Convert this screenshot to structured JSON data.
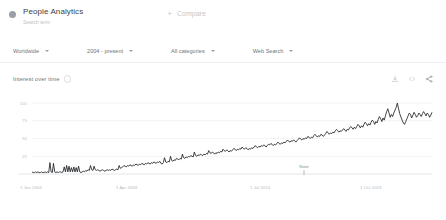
{
  "header": {
    "term_title": "People Analytics",
    "term_subtitle": "Search term",
    "compare_label": "Compare",
    "plus_glyph": "+",
    "dot_icon": "series-color-dot",
    "dot_color": "#9aa0a6"
  },
  "filters": [
    {
      "label": "Worldwide",
      "name": "location"
    },
    {
      "label": "2004 - present",
      "name": "time-range"
    },
    {
      "label": "All categories",
      "name": "category"
    },
    {
      "label": "Web Search",
      "name": "search-type"
    }
  ],
  "chart_card": {
    "title": "Interest over time",
    "help_icon": "help-circle-icon",
    "actions": [
      {
        "name": "download-icon",
        "label": "Download"
      },
      {
        "name": "embed-icon",
        "label": "Embed"
      },
      {
        "name": "share-icon",
        "label": "Share"
      }
    ]
  },
  "chart_data": {
    "type": "line",
    "title": "Interest over time",
    "xlabel": "",
    "ylabel": "",
    "ylim": [
      0,
      110
    ],
    "grid": true,
    "legend": false,
    "line_color": "#202124",
    "yticks": [
      100,
      75,
      50,
      25
    ],
    "xticks": [
      "1 Jan 2004",
      "1 Apr 2009",
      "1 Jul 2014",
      "1 Oct 2019"
    ],
    "xtick_positions_pct": [
      0.5,
      24.5,
      58.0,
      85.5
    ],
    "annotations": [
      {
        "label": "Note",
        "x_pct": 68.0,
        "y_pct": 88.0
      }
    ],
    "series": [
      {
        "name": "People Analytics",
        "values": [
          3,
          2,
          2,
          3,
          2,
          3,
          2,
          2,
          3,
          2,
          2,
          3,
          2,
          3,
          2,
          16,
          3,
          2,
          15,
          3,
          2,
          3,
          2,
          3,
          3,
          2,
          3,
          10,
          3,
          12,
          3,
          11,
          3,
          9,
          3,
          10,
          3,
          9,
          3,
          11,
          3,
          2,
          3,
          4,
          3,
          5,
          4,
          6,
          5,
          12,
          6,
          5,
          11,
          6,
          5,
          6,
          5,
          4,
          5,
          6,
          5,
          4,
          5,
          6,
          5,
          6,
          5,
          7,
          6,
          5,
          6,
          7,
          6,
          12,
          8,
          9,
          10,
          12,
          11,
          10,
          12,
          11,
          13,
          12,
          11,
          13,
          12,
          14,
          13,
          12,
          14,
          13,
          15,
          14,
          13,
          15,
          14,
          16,
          15,
          14,
          16,
          15,
          17,
          16,
          15,
          17,
          16,
          18,
          15,
          14,
          16,
          23,
          17,
          16,
          18,
          17,
          25,
          19,
          18,
          20,
          19,
          22,
          21,
          20,
          22,
          21,
          28,
          23,
          22,
          24,
          23,
          25,
          24,
          26,
          25,
          24,
          31,
          26,
          25,
          27,
          26,
          28,
          27,
          26,
          28,
          27,
          29,
          28,
          33,
          30,
          29,
          31,
          30,
          28,
          30,
          29,
          31,
          30,
          32,
          31,
          35,
          33,
          32,
          34,
          33,
          31,
          33,
          32,
          34,
          36,
          35,
          33,
          35,
          34,
          36,
          35,
          38,
          36,
          35,
          37,
          36,
          34,
          36,
          35,
          37,
          36,
          38,
          40,
          38,
          37,
          39,
          38,
          40,
          39,
          41,
          40,
          38,
          40,
          42,
          41,
          43,
          42,
          40,
          42,
          41,
          43,
          45,
          43,
          42,
          44,
          43,
          45,
          44,
          46,
          48,
          46,
          45,
          47,
          46,
          48,
          47,
          45,
          47,
          49,
          51,
          49,
          48,
          50,
          49,
          51,
          50,
          53,
          52,
          50,
          52,
          51,
          54,
          56,
          54,
          52,
          54,
          53,
          56,
          55,
          53,
          55,
          57,
          60,
          58,
          56,
          58,
          57,
          59,
          58,
          61,
          63,
          61,
          59,
          61,
          60,
          62,
          64,
          62,
          60,
          63,
          62,
          65,
          67,
          65,
          63,
          66,
          64,
          67,
          70,
          68,
          65,
          68,
          66,
          70,
          73,
          71,
          68,
          71,
          69,
          73,
          76,
          74,
          70,
          74,
          72,
          77,
          81,
          78,
          74,
          79,
          76,
          82,
          88,
          92,
          86,
          80,
          84,
          81,
          86,
          90,
          94,
          100,
          92,
          85,
          80,
          76,
          72,
          70,
          74,
          78,
          82,
          86,
          84,
          79,
          83,
          87,
          84,
          80,
          82,
          86,
          84,
          81,
          85,
          88,
          85,
          82,
          86,
          84,
          80,
          83,
          87
        ]
      }
    ]
  }
}
